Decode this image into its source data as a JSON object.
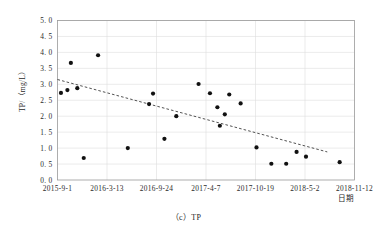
{
  "figure": {
    "caption": "（c）TP"
  },
  "chart_data": {
    "type": "scatter",
    "title": "",
    "xlabel": "日期",
    "ylabel": "TP/（mg/L）",
    "ylim": [
      0.0,
      5.0
    ],
    "ytick_labels": [
      "0. 0",
      "0. 5",
      "1. 0",
      "1. 5",
      "2. 0",
      "2. 5",
      "3. 0",
      "3. 5",
      "4. 0",
      "4. 5",
      "5. 0"
    ],
    "ytick_values": [
      0.0,
      0.5,
      1.0,
      1.5,
      2.0,
      2.5,
      3.0,
      3.5,
      4.0,
      4.5,
      5.0
    ],
    "xtick_labels": [
      "2015-9-1",
      "2016-3-13",
      "2016-9-24",
      "2017-4-7",
      "2017-10-19",
      "2018-5-2",
      "2018-11-12"
    ],
    "xtick_positions": [
      0,
      1,
      2,
      3,
      4,
      5,
      6
    ],
    "xlim": [
      0,
      6
    ],
    "grid": true,
    "legend": "none",
    "series": [
      {
        "name": "TP",
        "marker": "filled-circle",
        "color": "#111111",
        "points": [
          {
            "x": 0.07,
            "y": 2.73
          },
          {
            "x": 0.2,
            "y": 2.82
          },
          {
            "x": 0.27,
            "y": 3.67
          },
          {
            "x": 0.4,
            "y": 2.88
          },
          {
            "x": 0.53,
            "y": 0.69
          },
          {
            "x": 0.82,
            "y": 3.91
          },
          {
            "x": 1.42,
            "y": 1.0
          },
          {
            "x": 1.93,
            "y": 2.71
          },
          {
            "x": 1.85,
            "y": 2.38
          },
          {
            "x": 2.16,
            "y": 1.29
          },
          {
            "x": 2.4,
            "y": 2.0
          },
          {
            "x": 2.85,
            "y": 3.01
          },
          {
            "x": 3.08,
            "y": 2.72
          },
          {
            "x": 3.23,
            "y": 2.28
          },
          {
            "x": 3.47,
            "y": 2.68
          },
          {
            "x": 3.38,
            "y": 2.06
          },
          {
            "x": 3.28,
            "y": 1.7
          },
          {
            "x": 3.7,
            "y": 2.4
          },
          {
            "x": 4.02,
            "y": 1.02
          },
          {
            "x": 4.32,
            "y": 0.51
          },
          {
            "x": 4.62,
            "y": 0.51
          },
          {
            "x": 4.83,
            "y": 0.88
          },
          {
            "x": 5.02,
            "y": 0.73
          },
          {
            "x": 5.7,
            "y": 0.56
          }
        ]
      }
    ],
    "trendline": {
      "style": "dashed",
      "color": "#333333",
      "x_start": 0.0,
      "y_start": 3.15,
      "x_end": 5.45,
      "y_end": 0.88
    }
  }
}
